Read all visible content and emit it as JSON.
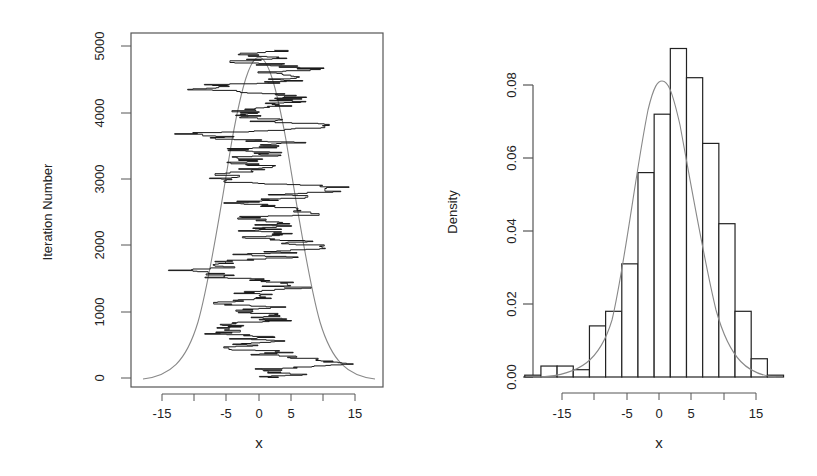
{
  "chart_data": [
    {
      "type": "line",
      "title": "",
      "xlabel": "x",
      "ylabel": "Iteration Number",
      "xlim": [
        -19,
        20
      ],
      "ylim": [
        0,
        5000
      ],
      "xticks": [
        -15,
        -10,
        -5,
        0,
        5,
        10,
        15
      ],
      "xtick_labels": [
        "-15",
        "",
        "-5",
        "0",
        "5",
        "",
        "15"
      ],
      "yticks": [
        0,
        1000,
        2000,
        3000,
        4000,
        5000
      ],
      "ytick_labels": [
        "0",
        "1000",
        "2000",
        "3000",
        "4000",
        "5000"
      ],
      "grid": false,
      "series": [
        {
          "name": "MCMC trace",
          "description": "random-walk Metropolis chain of 5000 iterations, x on horizontal axis, iteration on vertical; values range roughly -19 to 12"
        },
        {
          "name": "target density (scaled)",
          "description": "normal density centered at 0, sd ~5, scaled to span iterations 0-4900"
        }
      ]
    },
    {
      "type": "bar",
      "title": "",
      "xlabel": "x",
      "ylabel": "Density",
      "xlim": [
        -19,
        18
      ],
      "ylim": [
        0,
        0.09
      ],
      "xticks": [
        -15,
        -10,
        -5,
        0,
        5,
        10,
        15
      ],
      "xtick_labels": [
        "-15",
        "",
        "-5",
        "0",
        "5",
        "",
        "15"
      ],
      "yticks": [
        0,
        0.02,
        0.04,
        0.06,
        0.08
      ],
      "ytick_labels": [
        "0.00",
        "0.02",
        "0.04",
        "0.06",
        "0.08"
      ],
      "grid": false,
      "bin_edges": [
        -20,
        -17.5,
        -15,
        -12.5,
        -10,
        -7.5,
        -5,
        -2.5,
        0,
        2.5,
        5,
        7.5,
        10,
        12.5,
        15
      ],
      "categories": [
        "-20..-17.5",
        "-17.5..-15",
        "-15..-12.5",
        "-12.5..-10",
        "-10..-7.5",
        "-7.5..-5",
        "-5..-2.5",
        "-2.5..0",
        "0..2.5",
        "2.5..5",
        "5..7.5",
        "7.5..10",
        "10..12.5",
        "12.5..15"
      ],
      "values": [
        0.0005,
        0.003,
        0.003,
        0.002,
        0.014,
        0.018,
        0.031,
        0.056,
        0.072,
        0.09,
        0.082,
        0.064,
        0.042,
        0.018,
        0.005,
        0.0005
      ],
      "overlay": {
        "name": "normal density",
        "mean": 0,
        "sd": 4.9,
        "peak": 0.081
      }
    }
  ],
  "left_plot": {
    "ylabel": "Iteration Number",
    "xlabel": "x",
    "xtick_labels": [
      "-15",
      "-5",
      "0",
      "5",
      "15"
    ],
    "ytick_labels": [
      "0",
      "1000",
      "2000",
      "3000",
      "4000",
      "5000"
    ]
  },
  "right_plot": {
    "ylabel": "Density",
    "xlabel": "x",
    "xtick_labels": [
      "-15",
      "-5",
      "0",
      "5",
      "15"
    ],
    "ytick_labels": [
      "0.00",
      "0.02",
      "0.04",
      "0.06",
      "0.08"
    ]
  },
  "colors": {
    "ink": "#222222",
    "curve": "#777777",
    "frame": "#555555"
  }
}
